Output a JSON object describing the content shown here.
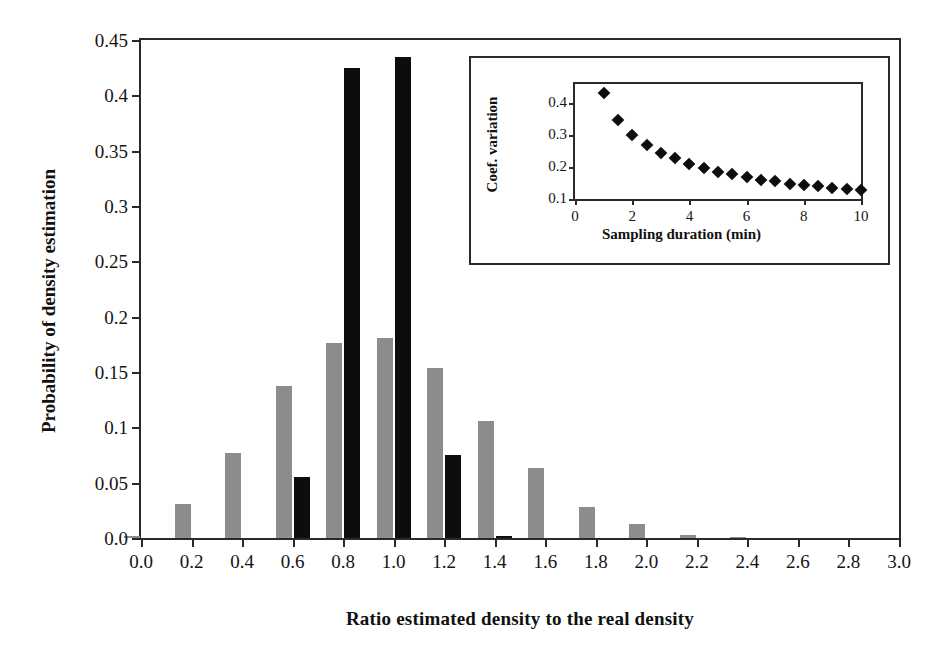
{
  "figure": {
    "background": "#ffffff",
    "series_colors": {
      "gray": "#8c8c8c",
      "black": "#0d0d0d"
    }
  },
  "chart_data": [
    {
      "id": "main",
      "type": "bar",
      "title": "",
      "xlabel": "Ratio estimated density to the real density",
      "ylabel": "Probability of density estimation",
      "xlim": [
        0.0,
        3.0
      ],
      "ylim": [
        0.0,
        0.45
      ],
      "grid": false,
      "legend": "none",
      "xticks": [
        "0.0",
        "0.2",
        "0.4",
        "0.6",
        "0.8",
        "1.0",
        "1.2",
        "1.4",
        "1.6",
        "1.8",
        "2.0",
        "2.2",
        "2.4",
        "2.6",
        "2.8",
        "3.0"
      ],
      "xtickvalues": [
        0.0,
        0.2,
        0.4,
        0.6,
        0.8,
        1.0,
        1.2,
        1.4,
        1.6,
        1.8,
        2.0,
        2.2,
        2.4,
        2.6,
        2.8,
        3.0
      ],
      "yticks": [
        "0.0",
        "0.05",
        "0.1",
        "0.15",
        "0.2",
        "0.25",
        "0.3",
        "0.35",
        "0.4",
        "0.45"
      ],
      "ytickvalues": [
        0.0,
        0.05,
        0.1,
        0.15,
        0.2,
        0.25,
        0.3,
        0.35,
        0.4,
        0.45
      ],
      "categories": [
        0.0,
        0.2,
        0.4,
        0.6,
        0.8,
        1.0,
        1.2,
        1.4,
        1.6,
        1.8,
        2.0,
        2.2,
        2.4,
        2.6,
        2.8,
        3.0
      ],
      "series": [
        {
          "name": "gray",
          "color": "#8c8c8c",
          "values": [
            0.002,
            0.031,
            0.077,
            0.137,
            0.176,
            0.181,
            0.154,
            0.106,
            0.063,
            0.028,
            0.013,
            0.003,
            0.0005,
            0.0,
            0.0,
            0.0
          ]
        },
        {
          "name": "black",
          "color": "#0d0d0d",
          "values": [
            0.0,
            0.0,
            0.0,
            0.055,
            0.425,
            0.435,
            0.075,
            0.002,
            0.0,
            0.0,
            0.0,
            0.0,
            0.0,
            0.0,
            0.0,
            0.0
          ]
        }
      ]
    },
    {
      "id": "inset",
      "type": "scatter",
      "title": "",
      "xlabel": "Sampling duration (min)",
      "ylabel": "Coef. variation",
      "xlim": [
        0,
        10
      ],
      "ylim": [
        0.1,
        0.46
      ],
      "grid": false,
      "legend": "none",
      "marker": "diamond",
      "marker_color": "#0d0d0d",
      "xticks": [
        "0",
        "2",
        "4",
        "6",
        "8",
        "10"
      ],
      "xtickvalues": [
        0,
        2,
        4,
        6,
        8,
        10
      ],
      "yticks": [
        "0.1",
        "0.2",
        "0.3",
        "0.4"
      ],
      "ytickvalues": [
        0.1,
        0.2,
        0.3,
        0.4
      ],
      "x": [
        1.0,
        1.5,
        2.0,
        2.5,
        3.0,
        3.5,
        4.0,
        4.5,
        5.0,
        5.5,
        6.0,
        6.5,
        7.0,
        7.5,
        8.0,
        8.5,
        9.0,
        9.5,
        10.0
      ],
      "y": [
        0.432,
        0.347,
        0.299,
        0.27,
        0.245,
        0.227,
        0.21,
        0.197,
        0.186,
        0.178,
        0.17,
        0.161,
        0.155,
        0.148,
        0.145,
        0.141,
        0.136,
        0.132,
        0.129
      ]
    }
  ]
}
